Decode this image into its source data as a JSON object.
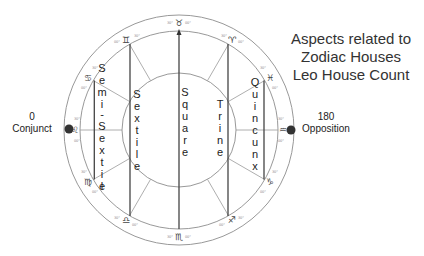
{
  "title": {
    "lines": [
      "Aspects related to",
      "Zodiac Houses",
      "Leo House Count"
    ]
  },
  "endpoints": {
    "conjunct": {
      "degree": "0",
      "label": "Conjunct"
    },
    "opposition": {
      "degree": "180",
      "label": "Opposition"
    }
  },
  "aspects": [
    {
      "name": "Semi-Sextile",
      "letters": [
        "S",
        "e",
        "m",
        "i",
        "-",
        "S",
        "e",
        "x",
        "t",
        "i",
        "l",
        "e"
      ]
    },
    {
      "name": "Sextile",
      "letters": [
        "S",
        "e",
        "x",
        "t",
        "i",
        "l",
        "e"
      ]
    },
    {
      "name": "Square",
      "letters": [
        "S",
        "q",
        "u",
        "a",
        "r",
        "e"
      ]
    },
    {
      "name": "Trine",
      "letters": [
        "T",
        "r",
        "i",
        "n",
        "e"
      ]
    },
    {
      "name": "Quincunx",
      "letters": [
        "Q",
        "u",
        "i",
        "n",
        "c",
        "u",
        "n",
        "x"
      ]
    }
  ],
  "zodiac_signs": [
    {
      "sign": "Leo",
      "glyph": "♌",
      "position": "left"
    },
    {
      "sign": "Cancer",
      "glyph": "♋",
      "position": "upper-left"
    },
    {
      "sign": "Gemini",
      "glyph": "♊",
      "position": "upper-left-2"
    },
    {
      "sign": "Taurus",
      "glyph": "♉",
      "position": "top"
    },
    {
      "sign": "Aries",
      "glyph": "♈",
      "position": "upper-right-2"
    },
    {
      "sign": "Pisces",
      "glyph": "♓",
      "position": "upper-right"
    },
    {
      "sign": "Aquarius",
      "glyph": "♒",
      "position": "right"
    },
    {
      "sign": "Capricorn",
      "glyph": "♑",
      "position": "lower-right"
    },
    {
      "sign": "Sagittarius",
      "glyph": "♐",
      "position": "lower-right-2"
    },
    {
      "sign": "Scorpio",
      "glyph": "♏",
      "position": "bottom"
    },
    {
      "sign": "Libra",
      "glyph": "♎",
      "position": "lower-left-2"
    },
    {
      "sign": "Virgo",
      "glyph": "♍",
      "position": "lower-left"
    }
  ],
  "degree_marks": [
    "30°",
    "00°"
  ],
  "colors": {
    "line": "#444444",
    "circle": "#999999",
    "text": "#222222",
    "dot": "#333333"
  }
}
